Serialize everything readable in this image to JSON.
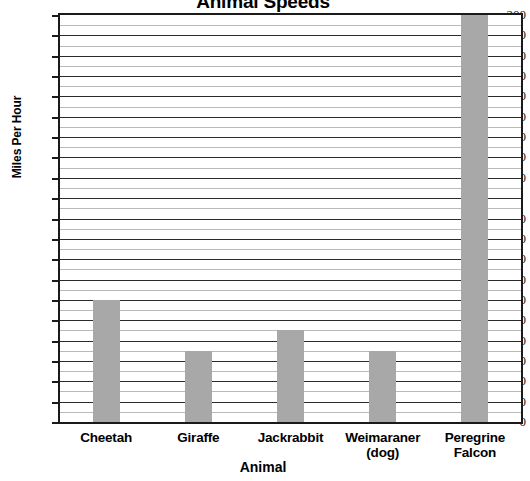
{
  "chart_data": {
    "type": "bar",
    "title": "Animal Speeds",
    "xlabel": "Animal",
    "ylabel": "Miles Per Hour",
    "categories": [
      "Cheetah",
      "Giraffe",
      "Jackrabbit",
      "Weimaraner (dog)",
      "Peregrine Falcon"
    ],
    "category_lines": [
      [
        "Cheetah"
      ],
      [
        "Giraffe"
      ],
      [
        "Jackrabbit"
      ],
      [
        "Weimaraner",
        "(dog)"
      ],
      [
        "Peregrine",
        "Falcon"
      ]
    ],
    "values": [
      60,
      35,
      45,
      35,
      200
    ],
    "ylim": [
      0,
      200
    ],
    "ytick_step": 10,
    "yticks": [
      0,
      10,
      20,
      30,
      40,
      50,
      60,
      70,
      80,
      90,
      100,
      110,
      120,
      130,
      140,
      150,
      160,
      170,
      180,
      190,
      200
    ],
    "ytick_labels": [
      "0",
      "10",
      "20",
      "30",
      "40",
      "50",
      "60",
      "70",
      "80",
      "90",
      "100",
      "",
      "120",
      "130",
      "140",
      "150",
      "160",
      "170",
      "180",
      "190",
      "200"
    ],
    "minor_gridline_step": 5,
    "grid": true,
    "legend": false,
    "bar_color": "#a8a8a8",
    "axis_color": "#1a1a1a",
    "gridline_color": "#2b2b2b",
    "minor_gridline_color": "#b9b9b9"
  }
}
